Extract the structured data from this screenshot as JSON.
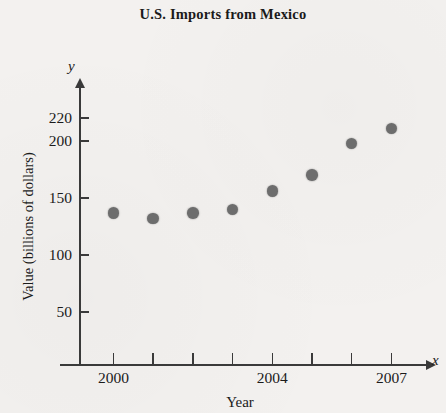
{
  "chart_data": {
    "type": "scatter",
    "title": "U.S. Imports from Mexico",
    "xlabel": "Year",
    "ylabel": "Value (billions of dollars)",
    "x_axis_variable": "x",
    "y_axis_variable": "y",
    "grid": false,
    "legend": "none",
    "xlim": [
      1999.5,
      2007.8
    ],
    "ylim": [
      0,
      232
    ],
    "x_tick_values": [
      2000,
      2001,
      2002,
      2003,
      2004,
      2005,
      2006,
      2007
    ],
    "x_tick_labels": [
      "2000",
      "",
      "",
      "",
      "2004",
      "",
      "",
      "2007"
    ],
    "y_tick_values": [
      50,
      100,
      150,
      200,
      220
    ],
    "y_tick_labels": [
      "50",
      "100",
      "150",
      "200",
      "220"
    ],
    "categories": [
      2000,
      2001,
      2002,
      2003,
      2004,
      2005,
      2006,
      2007
    ],
    "values": [
      137,
      132,
      137,
      140,
      156,
      170,
      198,
      211
    ],
    "point_color": "#6d6d6d",
    "axis_color": "#3a3a3a",
    "background_color": "#f3f1ef"
  }
}
